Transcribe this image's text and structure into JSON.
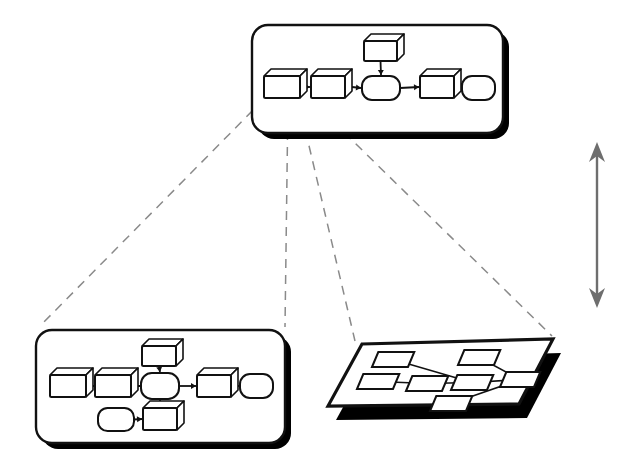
{
  "figure": {
    "background_color": "#ffffff",
    "stroke_color": "#111111",
    "shadow_color": "#000000",
    "dashed_color": "#8a8a8a",
    "arrow_color": "#6e6e6e",
    "panel_fill": "#ffffff"
  },
  "panels": [
    {
      "id": "top-panel",
      "name": "abstract-workflow-panel",
      "shape": "rounded-rect",
      "x": 252,
      "y": 25,
      "width": 251,
      "height": 108,
      "corner_radius": 16,
      "shadow_offset": 6,
      "nodes": [
        {
          "id": "t1",
          "type": "box3d",
          "x": 264,
          "y": 76,
          "w": 36,
          "h": 22
        },
        {
          "id": "t2",
          "type": "box3d",
          "x": 311,
          "y": 76,
          "w": 34,
          "h": 22
        },
        {
          "id": "t3",
          "type": "rounded",
          "x": 362,
          "y": 76,
          "w": 38,
          "h": 24
        },
        {
          "id": "t4",
          "type": "box3d",
          "x": 420,
          "y": 76,
          "w": 34,
          "h": 22
        },
        {
          "id": "t5",
          "type": "rounded",
          "x": 462,
          "y": 76,
          "w": 33,
          "h": 24
        },
        {
          "id": "t6",
          "type": "box3d",
          "x": 364,
          "y": 41,
          "w": 33,
          "h": 20
        }
      ],
      "edges": [
        {
          "from": "t1",
          "to": "t2",
          "dir": "right"
        },
        {
          "from": "t2",
          "to": "t3",
          "dir": "right"
        },
        {
          "from": "t3",
          "to": "t4",
          "dir": "right"
        },
        {
          "from": "t4",
          "to": "t5",
          "dir": "right"
        },
        {
          "from": "t6",
          "to": "t3",
          "dir": "down"
        }
      ]
    },
    {
      "id": "bottom-left-panel",
      "name": "expanded-workflow-panel",
      "shape": "rounded-rect",
      "x": 36,
      "y": 330,
      "width": 249,
      "height": 113,
      "corner_radius": 16,
      "shadow_offset": 6,
      "nodes": [
        {
          "id": "b1",
          "type": "box3d",
          "x": 50,
          "y": 375,
          "w": 36,
          "h": 22
        },
        {
          "id": "b2",
          "type": "box3d",
          "x": 95,
          "y": 375,
          "w": 36,
          "h": 22
        },
        {
          "id": "b3",
          "type": "rounded",
          "x": 141,
          "y": 373,
          "w": 38,
          "h": 26
        },
        {
          "id": "b4",
          "type": "box3d",
          "x": 197,
          "y": 375,
          "w": 34,
          "h": 22
        },
        {
          "id": "b5",
          "type": "rounded",
          "x": 240,
          "y": 374,
          "w": 33,
          "h": 24
        },
        {
          "id": "b6",
          "type": "box3d",
          "x": 142,
          "y": 346,
          "w": 34,
          "h": 20
        },
        {
          "id": "b7",
          "type": "rounded",
          "x": 98,
          "y": 408,
          "w": 36,
          "h": 23
        },
        {
          "id": "b8",
          "type": "box3d",
          "x": 143,
          "y": 408,
          "w": 34,
          "h": 22
        }
      ],
      "edges": [
        {
          "from": "b1",
          "to": "b2",
          "dir": "right"
        },
        {
          "from": "b2",
          "to": "b3",
          "dir": "right"
        },
        {
          "from": "b3",
          "to": "b4",
          "dir": "right"
        },
        {
          "from": "b4",
          "to": "b5",
          "dir": "right"
        },
        {
          "from": "b6",
          "to": "b3",
          "dir": "down"
        },
        {
          "from": "b3",
          "to": "b8",
          "dir": "down"
        },
        {
          "from": "b7",
          "to": "b8",
          "dir": "right"
        }
      ]
    }
  ],
  "plane": {
    "id": "bottom-right-plane",
    "name": "projected-graph-plane",
    "corners": {
      "top_left": {
        "x": 362,
        "y": 344
      },
      "top_right": {
        "x": 553,
        "y": 339
      },
      "bottom_right": {
        "x": 519,
        "y": 404
      },
      "bottom_left": {
        "x": 328,
        "y": 406
      }
    },
    "shadow_offset": {
      "x": 8,
      "y": 14
    },
    "nodes": [
      {
        "id": "p1",
        "x": 372,
        "y": 352,
        "w": 36,
        "h": 15
      },
      {
        "id": "p2",
        "x": 458,
        "y": 350,
        "w": 36,
        "h": 15
      },
      {
        "id": "p3",
        "x": 357,
        "y": 374,
        "w": 36,
        "h": 15
      },
      {
        "id": "p4",
        "x": 406,
        "y": 376,
        "w": 36,
        "h": 15
      },
      {
        "id": "p5",
        "x": 451,
        "y": 375,
        "w": 36,
        "h": 15
      },
      {
        "id": "p6",
        "x": 500,
        "y": 372,
        "w": 34,
        "h": 15
      },
      {
        "id": "p7",
        "x": 430,
        "y": 396,
        "w": 36,
        "h": 15
      }
    ],
    "edges": [
      {
        "from": "p1",
        "to": "p5"
      },
      {
        "from": "p3",
        "to": "p4"
      },
      {
        "from": "p4",
        "to": "p5"
      },
      {
        "from": "p5",
        "to": "p6"
      },
      {
        "from": "p2",
        "to": "p6"
      },
      {
        "from": "p7",
        "to": "p6"
      }
    ]
  },
  "projection_lines": [
    {
      "name": "projection-line-1",
      "x1": 264,
      "y1": 99,
      "x2": 40,
      "y2": 326
    },
    {
      "name": "projection-line-2",
      "x1": 288,
      "y1": 99,
      "x2": 285,
      "y2": 327
    },
    {
      "name": "projection-line-3",
      "x1": 298,
      "y1": 99,
      "x2": 355,
      "y2": 341
    },
    {
      "name": "projection-line-4",
      "x1": 310,
      "y1": 99,
      "x2": 552,
      "y2": 336
    }
  ],
  "scale_arrow": {
    "name": "abstraction-level-arrow",
    "x": 597,
    "y_top": 142,
    "y_bottom": 308,
    "color": "#6e6e6e",
    "double_headed": true
  }
}
